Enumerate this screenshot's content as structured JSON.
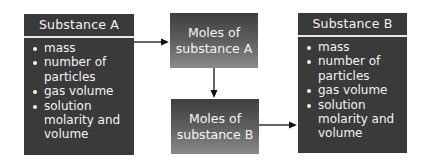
{
  "diagram": {
    "substance_a": {
      "title": "Substance A",
      "items": [
        "mass",
        "number of particles",
        "gas volume",
        "solution molarity and volume"
      ]
    },
    "moles_a": {
      "line1": "Moles of",
      "line2": "substance A"
    },
    "moles_b": {
      "line1": "Moles of",
      "line2": "substance B"
    },
    "substance_b": {
      "title": "Substance B",
      "items": [
        "mass",
        "number of particles",
        "gas volume",
        "solution molarity and volume"
      ]
    },
    "colors": {
      "dark_box": "#3a3a3a",
      "text": "#f4f4f4",
      "arrow": "#111111"
    }
  }
}
